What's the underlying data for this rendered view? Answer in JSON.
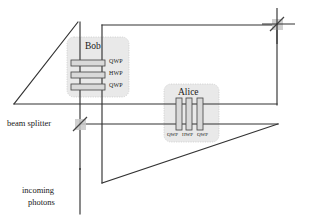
{
  "figure": {
    "background_color": "#ffffff",
    "line_color": "#333333",
    "box_fill": "#e8e8e8",
    "plate_fill": "#d8d8d8",
    "plate_stroke": "#555555"
  },
  "parties": {
    "bob": {
      "label": "Bob",
      "plates": [
        {
          "label": "QWP"
        },
        {
          "label": "HWP"
        },
        {
          "label": "QWP"
        }
      ]
    },
    "alice": {
      "label": "Alice",
      "plates": [
        {
          "label": "QWP"
        },
        {
          "label": "HWP"
        },
        {
          "label": "QWP"
        }
      ]
    }
  },
  "components": {
    "beam_splitter": {
      "label": "beam splitter",
      "name": "beam-splitter"
    },
    "mirror": {
      "label": "",
      "name": "mirror"
    }
  },
  "captions": {
    "input_line1": "incoming",
    "input_line2": "photons"
  }
}
